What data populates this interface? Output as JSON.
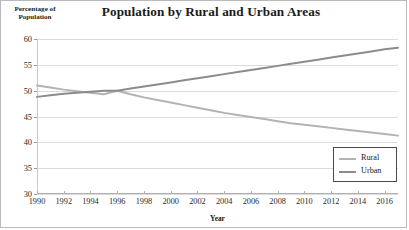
{
  "chart_data": {
    "type": "line",
    "title": "Population by Rural and Urban Areas",
    "xlabel": "Year",
    "ylabel": "Percentage of Population",
    "ylabel_line1": "Percentage of",
    "ylabel_line2": "Population",
    "x": [
      1990,
      1991,
      1992,
      1993,
      1994,
      1995,
      1996,
      1997,
      1998,
      1999,
      2000,
      2001,
      2002,
      2003,
      2004,
      2005,
      2006,
      2007,
      2008,
      2009,
      2010,
      2011,
      2012,
      2013,
      2014,
      2015,
      2016,
      2017
    ],
    "xlim": [
      1990,
      2017
    ],
    "ylim": [
      30,
      60
    ],
    "yticks": [
      30,
      35,
      40,
      45,
      50,
      55,
      60
    ],
    "xticks": [
      1990,
      1992,
      1994,
      1996,
      1998,
      2000,
      2002,
      2004,
      2006,
      2008,
      2010,
      2012,
      2014,
      2016
    ],
    "xtick_labels": [
      "1990",
      "1992",
      "1994",
      "1996",
      "1998",
      "2000",
      "2002",
      "2004",
      "2006",
      "2008",
      "2010",
      "2012",
      "2014",
      "2016"
    ],
    "ytick_labels": [
      "30",
      "35",
      "40",
      "45",
      "50",
      "55",
      "60"
    ],
    "grid": true,
    "legend_position": "bottom-right",
    "series": [
      {
        "name": "Rural",
        "color": "#b3b3b3",
        "values": [
          51.0,
          50.6,
          50.2,
          49.9,
          49.6,
          49.3,
          50.0,
          49.3,
          48.7,
          48.2,
          47.7,
          47.2,
          46.7,
          46.2,
          45.7,
          45.3,
          44.9,
          44.5,
          44.1,
          43.7,
          43.4,
          43.1,
          42.8,
          42.5,
          42.2,
          41.9,
          41.6,
          41.3
        ]
      },
      {
        "name": "Urban",
        "color": "#8c8c8c",
        "values": [
          48.8,
          49.1,
          49.4,
          49.6,
          49.8,
          50.0,
          50.0,
          50.4,
          50.8,
          51.2,
          51.6,
          52.0,
          52.4,
          52.8,
          53.2,
          53.6,
          54.0,
          54.4,
          54.8,
          55.2,
          55.6,
          56.0,
          56.4,
          56.8,
          57.2,
          57.6,
          58.0,
          58.3
        ]
      }
    ]
  }
}
